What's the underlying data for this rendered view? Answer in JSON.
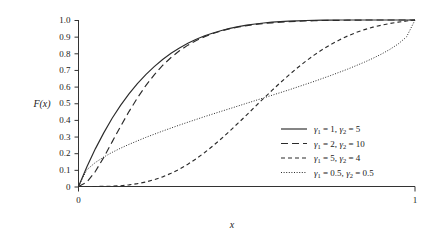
{
  "chart_data": {
    "type": "line",
    "title": "",
    "subtitle": "",
    "xlabel": "x",
    "ylabel": "F(x)",
    "xlim": [
      0,
      1
    ],
    "ylim": [
      0,
      1
    ],
    "grid": false,
    "legend_position": "lower-right inside plot area",
    "x_ticks": [
      "0",
      "1"
    ],
    "x_tick_values": [
      0,
      1
    ],
    "y_ticks": [
      "0",
      "0.1",
      "0.2",
      "0.3",
      "0.4",
      "0.5",
      "0.6",
      "0.7",
      "0.8",
      "0.9",
      "1.0"
    ],
    "y_tick_values": [
      0,
      0.1,
      0.2,
      0.3,
      0.4,
      0.5,
      0.6,
      0.7,
      0.8,
      0.9,
      1.0
    ],
    "x": [
      0,
      0.025,
      0.05,
      0.075,
      0.1,
      0.125,
      0.15,
      0.175,
      0.2,
      0.225,
      0.25,
      0.275,
      0.3,
      0.325,
      0.35,
      0.375,
      0.4,
      0.425,
      0.45,
      0.475,
      0.5,
      0.525,
      0.55,
      0.575,
      0.6,
      0.625,
      0.65,
      0.675,
      0.7,
      0.725,
      0.75,
      0.775,
      0.8,
      0.825,
      0.85,
      0.875,
      0.9,
      0.925,
      0.95,
      0.975,
      1
    ],
    "series": [
      {
        "name": "g1 = 1, g2 = 5",
        "gamma1": 1,
        "gamma2": 5,
        "style": "solid",
        "color": "#2b2b2b",
        "values": [
          0,
          0.119,
          0.226,
          0.322,
          0.41,
          0.487,
          0.556,
          0.618,
          0.672,
          0.72,
          0.763,
          0.8,
          0.832,
          0.86,
          0.884,
          0.905,
          0.922,
          0.937,
          0.95,
          0.96,
          0.969,
          0.976,
          0.982,
          0.987,
          0.99,
          0.993,
          0.995,
          0.997,
          0.998,
          0.999,
          0.999,
          1,
          1,
          1,
          1,
          1,
          1,
          1,
          1,
          1,
          1
        ]
      },
      {
        "name": "g1 = 2, g2 = 10",
        "gamma1": 2,
        "gamma2": 10,
        "style": "long-dash",
        "color": "#2b2b2b",
        "values": [
          0,
          0.026,
          0.09,
          0.175,
          0.268,
          0.361,
          0.45,
          0.532,
          0.606,
          0.671,
          0.727,
          0.775,
          0.815,
          0.849,
          0.877,
          0.9,
          0.919,
          0.935,
          0.948,
          0.958,
          0.966,
          0.973,
          0.979,
          0.983,
          0.987,
          0.99,
          0.992,
          0.994,
          0.996,
          0.997,
          0.998,
          0.998,
          0.999,
          0.999,
          1,
          1,
          1,
          1,
          1,
          1,
          1
        ]
      },
      {
        "name": "g1 = 5, g2 = 4",
        "gamma1": 5,
        "gamma2": 4,
        "style": "short-dash",
        "color": "#2b2b2b",
        "values": [
          0,
          0,
          0.0001,
          0.0006,
          0.002,
          0.0048,
          0.0096,
          0.017,
          0.027,
          0.041,
          0.058,
          0.079,
          0.104,
          0.134,
          0.167,
          0.204,
          0.245,
          0.288,
          0.334,
          0.382,
          0.43,
          0.48,
          0.529,
          0.577,
          0.624,
          0.669,
          0.712,
          0.752,
          0.789,
          0.823,
          0.853,
          0.88,
          0.904,
          0.925,
          0.942,
          0.957,
          0.969,
          0.979,
          0.987,
          0.994,
          1
        ]
      },
      {
        "name": "g1 = 0.5, g2 = 0.5",
        "gamma1": 0.5,
        "gamma2": 0.5,
        "style": "dotted",
        "color": "#2b2b2b",
        "values": [
          0,
          0.101,
          0.144,
          0.177,
          0.205,
          0.23,
          0.253,
          0.274,
          0.295,
          0.314,
          0.333,
          0.351,
          0.369,
          0.386,
          0.403,
          0.42,
          0.436,
          0.452,
          0.468,
          0.484,
          0.5,
          0.516,
          0.532,
          0.548,
          0.564,
          0.58,
          0.597,
          0.614,
          0.631,
          0.649,
          0.667,
          0.686,
          0.705,
          0.726,
          0.747,
          0.77,
          0.795,
          0.823,
          0.856,
          0.899,
          1
        ]
      }
    ]
  },
  "axes": {
    "ylabel": "F(x)",
    "xlabel": "x",
    "y_ticks": [
      {
        "label": "1.0",
        "value": 1.0
      },
      {
        "label": "0.9",
        "value": 0.9
      },
      {
        "label": "0.8",
        "value": 0.8
      },
      {
        "label": "0.7",
        "value": 0.7
      },
      {
        "label": "0.6",
        "value": 0.6
      },
      {
        "label": "0.5",
        "value": 0.5
      },
      {
        "label": "0.4",
        "value": 0.4
      },
      {
        "label": "0.3",
        "value": 0.3
      },
      {
        "label": "0.2",
        "value": 0.2
      },
      {
        "label": "0.1",
        "value": 0.1
      },
      {
        "label": "0",
        "value": 0.0
      }
    ],
    "x_ticks": [
      {
        "label": "0",
        "value": 0
      },
      {
        "label": "1",
        "value": 1
      }
    ]
  },
  "legend": {
    "entries": [
      {
        "style": "solid",
        "g1_symbol": "γ",
        "g1_sub": "1",
        "g1_eq": " = 1, ",
        "g2_symbol": "γ",
        "g2_sub": "2",
        "g2_eq": " = 5",
        "full_text": "γ1 = 1, γ2 = 5"
      },
      {
        "style": "long-dash",
        "g1_symbol": "γ",
        "g1_sub": "1",
        "g1_eq": " = 2, ",
        "g2_symbol": "γ",
        "g2_sub": "2",
        "g2_eq": " = 10",
        "full_text": "γ1 = 2, γ2 = 10"
      },
      {
        "style": "short-dash",
        "g1_symbol": "γ",
        "g1_sub": "1",
        "g1_eq": " = 5, ",
        "g2_symbol": "γ",
        "g2_sub": "2",
        "g2_eq": " = 4",
        "full_text": "γ1 = 5, γ2 = 4"
      },
      {
        "style": "dotted",
        "g1_symbol": "γ",
        "g1_sub": "1",
        "g1_eq": " = 0.5, ",
        "g2_symbol": "γ",
        "g2_sub": "2",
        "g2_eq": " = 0.5",
        "full_text": "γ1 = 0.5, γ2 = 0.5"
      }
    ]
  },
  "colors": {
    "background": "#ffffff",
    "line": "#2b2b2b",
    "axis": "#333333",
    "text": "#1a1a1a"
  }
}
